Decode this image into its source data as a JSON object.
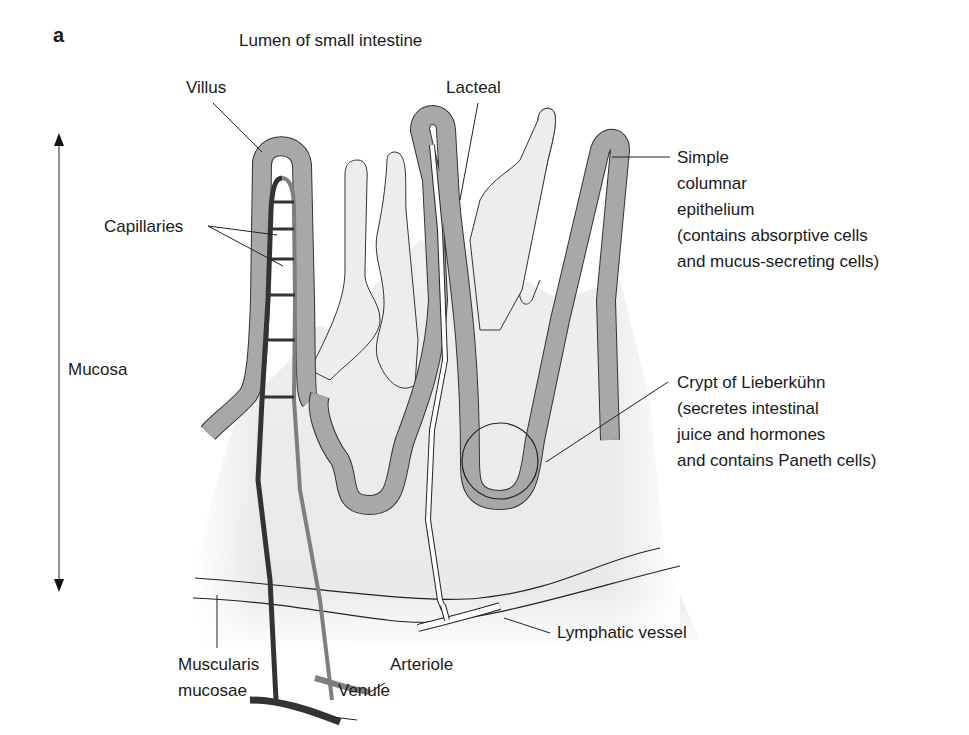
{
  "figure": {
    "panel_letter": "a",
    "title": "Lumen of small intestine"
  },
  "labels": {
    "villus": "Villus",
    "lacteal": "Lacteal",
    "capillaries": "Capillaries",
    "mucosa": "Mucosa",
    "epithelium": [
      "Simple",
      "columnar",
      "epithelium",
      "(contains absorptive cells",
      "and mucus-secreting cells)"
    ],
    "crypt": [
      "Crypt of Lieberkühn",
      "(secretes intestinal",
      "juice and hormones",
      "and contains Paneth cells)"
    ],
    "lymphatic_vessel": "Lymphatic vessel",
    "arteriole": "Arteriole",
    "venule": "Venule",
    "muscularis": [
      "Muscularis",
      "mucosae"
    ]
  },
  "colors": {
    "epithelium_fill": "#a8a8a8",
    "nucleus": "#7a7a7a",
    "lamina_propria": "#ececec",
    "venule": "#3a3a3a",
    "arteriole": "#8a8a8a",
    "outline": "#222222",
    "background": "#ffffff"
  }
}
